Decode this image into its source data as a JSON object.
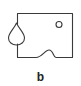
{
  "figure": {
    "label": "b",
    "stroke_color": "#3a3a3a",
    "background": "#ffffff",
    "shapes": {
      "outline": "rectangle-with-bottom-bump",
      "left_feature": "teardrop",
      "top_right_feature": "small-circle"
    }
  }
}
